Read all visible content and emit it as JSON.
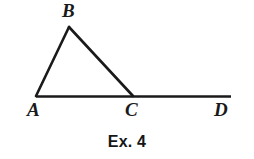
{
  "figure": {
    "caption": "Ex. 4",
    "background_color": "#ffffff",
    "stroke_color": "#1a1a1a",
    "stroke_width": 2.6,
    "points": {
      "A": {
        "label": "A",
        "x": 36,
        "y": 96
      },
      "B": {
        "label": "B",
        "x": 69,
        "y": 27
      },
      "C": {
        "label": "C",
        "x": 133,
        "y": 96
      },
      "D": {
        "label": "D",
        "x": 231,
        "y": 96
      }
    },
    "segments": [
      {
        "name": "AB",
        "from": "A",
        "to": "B"
      },
      {
        "name": "BC",
        "from": "B",
        "to": "C"
      },
      {
        "name": "AD",
        "from": "A",
        "to": "D"
      }
    ],
    "labels": [
      {
        "id": "A",
        "text": "A"
      },
      {
        "id": "B",
        "text": "B"
      },
      {
        "id": "C",
        "text": "C"
      },
      {
        "id": "D",
        "text": "D"
      }
    ]
  }
}
